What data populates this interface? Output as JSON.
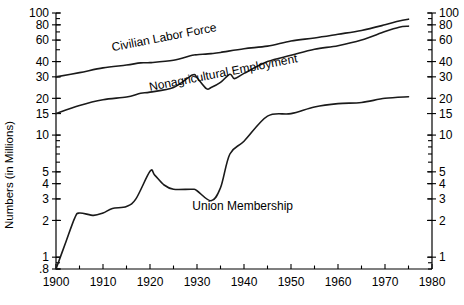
{
  "chart_data": {
    "type": "line",
    "title": "",
    "xlabel": "",
    "ylabel": "Numbers (in Millions)",
    "scale": "log-y",
    "xlim": [
      1900,
      1980
    ],
    "ylim": [
      0.8,
      100
    ],
    "grid": false,
    "legend": "inline-labels",
    "x_ticks": [
      1900,
      1910,
      1920,
      1930,
      1940,
      1950,
      1960,
      1970,
      1980
    ],
    "x_tick_labels": [
      "1900",
      "1910",
      "1920",
      "1930",
      "1940",
      "1950",
      "1960",
      "1970",
      "1980"
    ],
    "y_ticks": [
      0.8,
      1,
      2,
      3,
      4,
      5,
      10,
      15,
      20,
      30,
      40,
      60,
      80,
      100
    ],
    "y_tick_labels": [
      ".8",
      "1",
      "2",
      "3",
      "4",
      "5",
      "10",
      "15",
      "20",
      "30",
      "40",
      "60",
      "80",
      "100"
    ],
    "y_ticks_right": [
      1,
      2,
      3,
      4,
      5,
      10,
      15,
      20,
      30,
      40,
      60,
      80,
      100
    ],
    "y_tick_labels_right": [
      "1",
      "2",
      "3",
      "4",
      "5",
      "10",
      "15",
      "20",
      "30",
      "40",
      "60",
      "80",
      "100"
    ],
    "series": [
      {
        "name": "Civilian Labor Force",
        "label_rotation": -11,
        "x": [
          1900,
          1905,
          1910,
          1915,
          1918,
          1920,
          1925,
          1929,
          1930,
          1933,
          1935,
          1940,
          1945,
          1950,
          1955,
          1960,
          1965,
          1970,
          1973,
          1975
        ],
        "values": [
          30.0,
          32.5,
          35.5,
          37.5,
          39.0,
          39.2,
          41.0,
          45.0,
          45.5,
          46.5,
          47.5,
          51.0,
          53.5,
          59.0,
          62.5,
          67.0,
          72.0,
          80.0,
          86.0,
          89.0
        ]
      },
      {
        "name": "Nonagricultural Employment",
        "label_rotation": -11,
        "x": [
          1900,
          1905,
          1910,
          1915,
          1918,
          1920,
          1925,
          1929,
          1930,
          1932,
          1933,
          1935,
          1937,
          1938,
          1940,
          1945,
          1950,
          1955,
          1960,
          1965,
          1970,
          1973,
          1975
        ],
        "values": [
          15.0,
          17.5,
          19.5,
          20.5,
          22.0,
          22.5,
          24.5,
          31.0,
          29.5,
          24.0,
          24.5,
          27.0,
          31.5,
          29.0,
          32.0,
          40.0,
          45.0,
          50.5,
          54.0,
          60.0,
          70.5,
          76.5,
          78.0
        ]
      },
      {
        "name": "Union Membership",
        "label_rotation": 0,
        "x": [
          1900,
          1902,
          1904,
          1905,
          1908,
          1910,
          1912,
          1915,
          1917,
          1920,
          1921,
          1923,
          1925,
          1929,
          1930,
          1933,
          1935,
          1937,
          1940,
          1945,
          1950,
          1955,
          1960,
          1965,
          1970,
          1975
        ],
        "values": [
          0.8,
          1.3,
          2.1,
          2.3,
          2.2,
          2.3,
          2.5,
          2.6,
          3.0,
          5.05,
          4.7,
          3.9,
          3.6,
          3.6,
          3.5,
          2.9,
          3.7,
          7.0,
          8.9,
          14.3,
          15.0,
          17.0,
          18.1,
          18.5,
          20.0,
          20.6
        ]
      }
    ],
    "annotations": [
      {
        "text": "Civilian Labor Force",
        "x": 1912,
        "y": 48.5
      },
      {
        "text": "Nonagricultural Employment",
        "x": 1920,
        "y": 23.0
      },
      {
        "text": "Union Membership",
        "x": 1929,
        "y": 2.45
      }
    ]
  }
}
